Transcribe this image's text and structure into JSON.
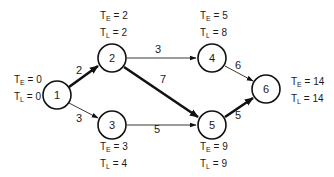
{
  "diagram": {
    "type": "network-critical-path",
    "nodes": [
      {
        "id": "1",
        "label": "1",
        "x": 57,
        "y": 95,
        "te_label": "T",
        "te_sub": "E",
        "te_text": " = 0",
        "tl_label": "T",
        "tl_sub": "L",
        "tl_text": " = 0"
      },
      {
        "id": "2",
        "label": "2",
        "x": 112,
        "y": 58,
        "te_label": "T",
        "te_sub": "E",
        "te_text": " = 2",
        "tl_label": "T",
        "tl_sub": "L",
        "tl_text": " = 2"
      },
      {
        "id": "3",
        "label": "3",
        "x": 112,
        "y": 125,
        "te_label": "T",
        "te_sub": "E",
        "te_text": " = 3",
        "tl_label": "T",
        "tl_sub": "L",
        "tl_text": " = 4"
      },
      {
        "id": "4",
        "label": "4",
        "x": 212,
        "y": 58,
        "te_label": "T",
        "te_sub": "E",
        "te_text": " = 5",
        "tl_label": "T",
        "tl_sub": "L",
        "tl_text": " = 8"
      },
      {
        "id": "5",
        "label": "5",
        "x": 212,
        "y": 125,
        "te_label": "T",
        "te_sub": "E",
        "te_text": " = 9",
        "tl_label": "T",
        "tl_sub": "L",
        "tl_text": " = 9"
      },
      {
        "id": "6",
        "label": "6",
        "x": 266,
        "y": 89,
        "te_label": "T",
        "te_sub": "E",
        "te_text": " = 14",
        "tl_label": "T",
        "tl_sub": "L",
        "tl_text": " = 14"
      }
    ],
    "edges": [
      {
        "from": "1",
        "to": "2",
        "weight": "2",
        "critical": true
      },
      {
        "from": "1",
        "to": "3",
        "weight": "3",
        "critical": false
      },
      {
        "from": "2",
        "to": "4",
        "weight": "3",
        "critical": false
      },
      {
        "from": "2",
        "to": "5",
        "weight": "7",
        "critical": true
      },
      {
        "from": "3",
        "to": "5",
        "weight": "5",
        "critical": false
      },
      {
        "from": "4",
        "to": "6",
        "weight": "6",
        "critical": false
      },
      {
        "from": "5",
        "to": "6",
        "weight": "5",
        "critical": true
      }
    ],
    "colors": {
      "stroke": "#111111",
      "background": "#ffffff"
    }
  }
}
